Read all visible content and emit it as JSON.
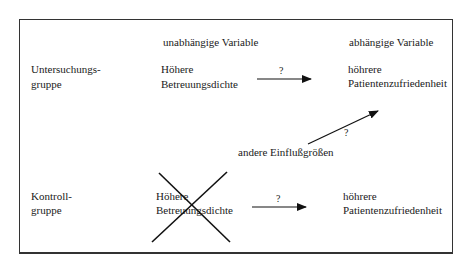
{
  "diagram": {
    "column_headers": {
      "independent": "unabhängige Variable",
      "dependent": "abhängige Variable"
    },
    "rows": [
      {
        "group_line1": "Untersuchungs-",
        "group_line2": "gruppe",
        "independent_line1": "Höhere",
        "independent_line2": "Betreuungsdichte",
        "arrow_label": "?",
        "dependent_line1": "höhrere",
        "dependent_line2": "Patientenzufriedenheit",
        "crossed_out": false
      },
      {
        "group_line1": "Kontroll-",
        "group_line2": "gruppe",
        "independent_line1": "Höhere",
        "independent_line2": "Betreuungsdichte",
        "arrow_label": "?",
        "dependent_line1": "höhrere",
        "dependent_line2": "Patientenzufriedenheit",
        "crossed_out": true
      }
    ],
    "other_factors": {
      "label": "andere Einflußgrößen",
      "arrow_label": "?"
    }
  }
}
